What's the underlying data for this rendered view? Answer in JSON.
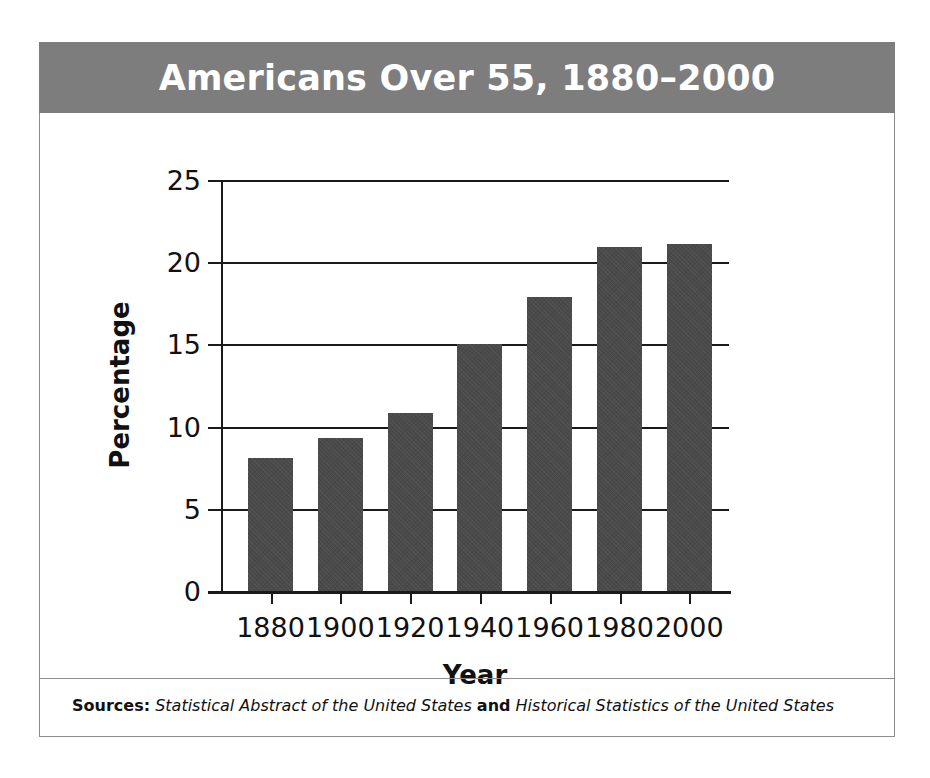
{
  "figure": {
    "title": "Americans Over 55, 1880–2000",
    "banner_color": "#7d7d7d",
    "bar_color": "#4a4a4a",
    "axis_color": "#1a1a1a",
    "frame_border_color": "#8c8c8c",
    "background": "#ffffff"
  },
  "source_note": {
    "label": "Sources:",
    "first_source": "Statistical Abstract of the United States",
    "conjunction": "and",
    "second_source": "Historical Statistics of the United States"
  },
  "chart_data": {
    "type": "bar",
    "title": "Americans Over 55, 1880–2000",
    "xlabel": "Year",
    "ylabel": "Percentage",
    "categories": [
      "1880",
      "1900",
      "1920",
      "1940",
      "1960",
      "1980",
      "2000"
    ],
    "values": [
      8.1,
      9.3,
      10.8,
      15.0,
      17.9,
      20.9,
      21.1
    ],
    "ylim": [
      0,
      25
    ],
    "yticks": [
      "0",
      "5",
      "10",
      "15",
      "20",
      "25"
    ],
    "ytick_values": [
      0,
      5,
      10,
      15,
      20,
      25
    ],
    "grid": "horizontal",
    "legend": "none",
    "series_color": "#4a4a4a"
  }
}
